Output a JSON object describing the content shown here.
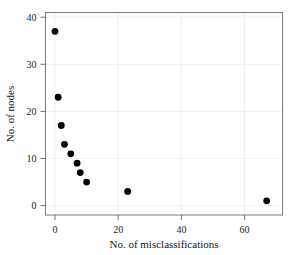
{
  "chart_data": {
    "type": "scatter",
    "title": "",
    "xlabel": "No. of misclassifications",
    "ylabel": "No. of nodes",
    "xlim": [
      -3,
      72
    ],
    "ylim": [
      -2,
      41
    ],
    "xticks": [
      0,
      20,
      40,
      60
    ],
    "xtick_labels": [
      "0",
      "20",
      "40",
      "60"
    ],
    "yticks": [
      0,
      10,
      20,
      30,
      40
    ],
    "ytick_labels": [
      "0",
      "10",
      "20",
      "30",
      "40"
    ],
    "grid": true,
    "legend": "none",
    "marker": "filled-circle",
    "marker_color": "#000000",
    "x": [
      0,
      1,
      2,
      3,
      5,
      6,
      8,
      9,
      11,
      23,
      67
    ],
    "y": [
      37,
      23,
      17,
      13,
      11,
      9,
      7,
      5,
      3,
      1
    ],
    "points": [
      {
        "x": 0,
        "y": 37
      },
      {
        "x": 1,
        "y": 23
      },
      {
        "x": 2,
        "y": 17
      },
      {
        "x": 3,
        "y": 13
      },
      {
        "x": 5,
        "y": 11
      },
      {
        "x": 7,
        "y": 9
      },
      {
        "x": 8,
        "y": 7
      },
      {
        "x": 10,
        "y": 5
      },
      {
        "x": 23,
        "y": 3
      },
      {
        "x": 67,
        "y": 1
      }
    ]
  },
  "figure": {
    "background": "#ffffff",
    "frame_color": "#7c7c7c",
    "grid_color": "#e8e8e8"
  }
}
